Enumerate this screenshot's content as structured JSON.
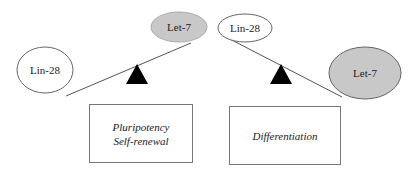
{
  "left_panel": {
    "lin28": {
      "label": "Lin-28",
      "fill": "#ffffff"
    },
    "let7": {
      "label": "Let-7",
      "fill": "#c8c8c8"
    },
    "outcome": {
      "line1": "Pluripotency",
      "line2": "Self-renewal"
    }
  },
  "right_panel": {
    "lin28": {
      "label": "Lin-28",
      "fill": "#ffffff"
    },
    "let7": {
      "label": "Let-7",
      "fill": "#c8c8c8"
    },
    "outcome": {
      "line1": "Differentiation"
    }
  }
}
